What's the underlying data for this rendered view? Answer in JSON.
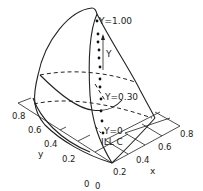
{
  "figure": {
    "labels": {
      "y_top": "Y=1.00",
      "y_mid": "Y=0.30",
      "y_bottom": "Y=0",
      "axis_Y": "Y",
      "illuminant": "ILL C",
      "axis_x": "x",
      "axis_y": "y"
    },
    "x_ticks": [
      "0",
      "0.2",
      "0.4",
      "0.6",
      "0.8"
    ],
    "y_ticks": [
      "0",
      "0.2",
      "0.4",
      "0.6",
      "0.8"
    ],
    "colors": {
      "ink": "#222222",
      "background": "#ffffff"
    }
  }
}
